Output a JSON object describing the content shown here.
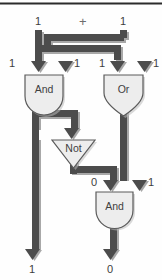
{
  "diagram": {
    "top_symbol": "+",
    "colors": {
      "wire": "#4c4c4c",
      "wire_shadow": "#9a9a9a",
      "gate_fill": "#ededed",
      "gate_stroke": "#5a5a5a",
      "label_text": "#3d3d3d",
      "background": "#fefefe",
      "top_rule": "#2b2b2b"
    },
    "gates": [
      {
        "id": "and-top",
        "label": "And",
        "shape": "and"
      },
      {
        "id": "or-top",
        "label": "Or",
        "shape": "or"
      },
      {
        "id": "not-mid",
        "label": "Not",
        "shape": "not"
      },
      {
        "id": "and-bottom",
        "label": "And",
        "shape": "and"
      }
    ],
    "signals": {
      "input_top_left": "1",
      "input_top_right": "1",
      "and_in_left": "1",
      "and_in_right": "1",
      "or_in_left": "1",
      "or_in_right": "1",
      "and2_in_left": "0",
      "and2_in_right": "1",
      "output_left": "1",
      "output_right": "0"
    }
  }
}
